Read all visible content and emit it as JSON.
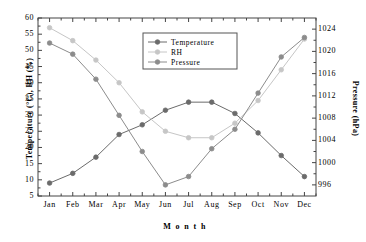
{
  "chart_data": {
    "type": "line",
    "title": "",
    "subtitle": "",
    "xlabel": "M o n t h",
    "ylabel": "Temperature (°C), RH (%)",
    "ylabel_right": "Pressure (hPa)",
    "categories": [
      "Jan",
      "Feb",
      "Mar",
      "Apr",
      "May",
      "Jun",
      "Jul",
      "Aug",
      "Sep",
      "Oct",
      "Nov",
      "Dec"
    ],
    "ylim": [
      5,
      60
    ],
    "yticks": [
      5,
      10,
      15,
      20,
      25,
      30,
      35,
      40,
      45,
      50,
      55,
      60
    ],
    "ylim_right": [
      994,
      1026
    ],
    "yticks_right": [
      996,
      1000,
      1004,
      1008,
      1012,
      1016,
      1020,
      1024
    ],
    "grid": false,
    "legend_position": "top-center",
    "series": [
      {
        "name": "Temperature",
        "axis": "left",
        "color": "#6b6b6b",
        "marker": "circle",
        "values": [
          9,
          12,
          17,
          24,
          27,
          31.5,
          34,
          34,
          30.5,
          24.5,
          17.5,
          11
        ]
      },
      {
        "name": "RH",
        "axis": "left",
        "color": "#c6c6c6",
        "marker": "circle",
        "values": [
          57,
          53,
          47,
          40,
          31,
          25,
          23,
          23,
          27.5,
          34.5,
          44,
          53.5
        ]
      },
      {
        "name": "Pressure",
        "axis": "right",
        "color": "#8c8c8c",
        "marker": "circle",
        "values": [
          1021.5,
          1019.5,
          1015,
          1008.5,
          1002,
          996,
          997.5,
          1002.5,
          1006,
          1012.5,
          1019,
          1022.5
        ]
      }
    ]
  },
  "legend": {
    "entries": [
      "Temperature",
      "RH",
      "Pressure"
    ]
  }
}
